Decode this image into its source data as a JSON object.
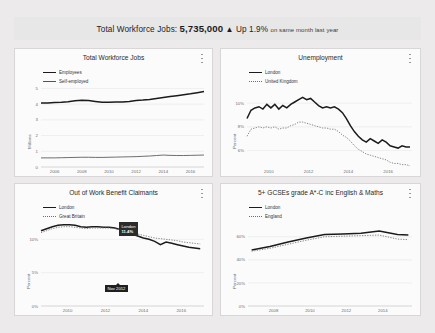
{
  "banner": {
    "label": "Total Workforce Jobs:",
    "value": "5,735,000",
    "arrow": "▲",
    "change": "Up 1.9%",
    "suffix": "on same month last year"
  },
  "icons": {
    "info": "info-icon"
  },
  "chart_data": [
    {
      "type": "line",
      "title": "Total Workforce Jobs",
      "xlabel": "",
      "ylabel": "Millions",
      "ylim": [
        0,
        5.6
      ],
      "yticks": [
        "0",
        "1",
        "2",
        "3",
        "4",
        "5"
      ],
      "ytickvals": [
        0,
        1,
        2,
        3,
        4,
        5
      ],
      "xlim": [
        2005.0,
        2017.0
      ],
      "xticks": [
        "2006",
        "2008",
        "2010",
        "2012",
        "2014",
        "2016"
      ],
      "xtickvals": [
        2006,
        2008,
        2010,
        2012,
        2014,
        2016
      ],
      "grid": true,
      "legend_position": "top-left",
      "x": [
        2005.0,
        2005.5,
        2006.0,
        2006.5,
        2007.0,
        2007.5,
        2008.0,
        2008.5,
        2009.0,
        2009.5,
        2010.0,
        2010.5,
        2011.0,
        2011.5,
        2012.0,
        2012.5,
        2013.0,
        2013.5,
        2014.0,
        2014.5,
        2015.0,
        2015.5,
        2016.0,
        2016.5,
        2017.0
      ],
      "series": [
        {
          "name": "Employees",
          "style": "solid",
          "values": [
            4.08,
            4.08,
            4.1,
            4.12,
            4.16,
            4.21,
            4.25,
            4.23,
            4.17,
            4.12,
            4.12,
            4.14,
            4.13,
            4.17,
            4.23,
            4.26,
            4.3,
            4.36,
            4.42,
            4.48,
            4.54,
            4.6,
            4.66,
            4.73,
            4.8
          ]
        },
        {
          "name": "Self-employed",
          "style": "thin",
          "values": [
            0.58,
            0.58,
            0.58,
            0.59,
            0.6,
            0.61,
            0.62,
            0.62,
            0.61,
            0.61,
            0.62,
            0.63,
            0.64,
            0.65,
            0.66,
            0.68,
            0.7,
            0.73,
            0.76,
            0.74,
            0.73,
            0.73,
            0.74,
            0.75,
            0.76
          ]
        }
      ]
    },
    {
      "type": "line",
      "title": "Unemployment",
      "xlabel": "",
      "ylabel": "Percent",
      "ylim": [
        4.6,
        11.2
      ],
      "yticks": [
        "6%",
        "8%",
        "10%"
      ],
      "ytickvals": [
        6,
        8,
        10
      ],
      "xlim": [
        2008.9,
        2017.2
      ],
      "xticks": [
        "2010",
        "2012",
        "2014",
        "2016"
      ],
      "xtickvals": [
        2010,
        2012,
        2014,
        2016
      ],
      "grid": true,
      "legend_position": "top-left",
      "x": [
        2008.9,
        2009.1,
        2009.3,
        2009.5,
        2009.7,
        2009.9,
        2010.1,
        2010.3,
        2010.5,
        2010.7,
        2010.9,
        2011.1,
        2011.3,
        2011.5,
        2011.7,
        2011.9,
        2012.1,
        2012.3,
        2012.5,
        2012.7,
        2012.9,
        2013.1,
        2013.3,
        2013.5,
        2013.7,
        2013.9,
        2014.1,
        2014.3,
        2014.5,
        2014.7,
        2014.9,
        2015.1,
        2015.3,
        2015.5,
        2015.7,
        2015.9,
        2016.1,
        2016.3,
        2016.5,
        2016.7,
        2016.9,
        2017.1
      ],
      "series": [
        {
          "name": "London",
          "style": "solid",
          "values": [
            8.7,
            9.4,
            9.6,
            9.7,
            9.5,
            9.9,
            9.6,
            9.9,
            9.5,
            9.8,
            9.6,
            9.9,
            10.1,
            10.3,
            10.5,
            10.3,
            10.4,
            10.1,
            9.8,
            9.6,
            9.7,
            9.6,
            9.7,
            9.5,
            9.2,
            8.7,
            8.1,
            7.6,
            7.2,
            6.9,
            6.7,
            7.0,
            6.8,
            6.6,
            6.9,
            6.7,
            6.4,
            6.3,
            6.2,
            6.4,
            6.3,
            6.3
          ]
        },
        {
          "name": "United Kingdom",
          "style": "dotted",
          "values": [
            7.2,
            7.8,
            7.9,
            8.0,
            7.9,
            8.0,
            7.9,
            8.0,
            7.8,
            7.9,
            7.9,
            8.1,
            8.2,
            8.4,
            8.4,
            8.3,
            8.2,
            8.1,
            8.0,
            7.9,
            7.9,
            7.8,
            7.8,
            7.6,
            7.3,
            7.1,
            6.8,
            6.4,
            6.1,
            5.9,
            5.7,
            5.6,
            5.5,
            5.4,
            5.3,
            5.2,
            5.0,
            4.9,
            4.9,
            4.8,
            4.8,
            4.7
          ]
        }
      ]
    },
    {
      "type": "line",
      "title": "Out of Work Benefit Claimants",
      "xlabel": "",
      "ylabel": "Percent",
      "ylim": [
        0,
        13.5
      ],
      "yticks": [
        "0%",
        "5%",
        "10%"
      ],
      "ytickvals": [
        0,
        5,
        10
      ],
      "xlim": [
        2008.6,
        2017.2
      ],
      "xticks": [
        "2010",
        "2012",
        "2014",
        "2016"
      ],
      "xtickvals": [
        2010,
        2012,
        2014,
        2016
      ],
      "grid": true,
      "legend_position": "top-left",
      "x": [
        2008.6,
        2008.9,
        2009.2,
        2009.5,
        2009.8,
        2010.1,
        2010.4,
        2010.7,
        2011.0,
        2011.3,
        2011.6,
        2011.9,
        2012.2,
        2012.5,
        2012.85,
        2013.1,
        2013.4,
        2013.7,
        2014.0,
        2014.3,
        2014.6,
        2014.9,
        2015.2,
        2015.5,
        2015.8,
        2016.1,
        2016.4,
        2016.7,
        2017.0
      ],
      "series": [
        {
          "name": "London",
          "style": "solid",
          "values": [
            11.3,
            11.6,
            11.9,
            12.1,
            12.2,
            12.2,
            12.1,
            11.9,
            11.8,
            11.9,
            11.9,
            11.8,
            11.8,
            11.7,
            11.4,
            11.1,
            10.8,
            10.5,
            10.2,
            10.0,
            9.7,
            9.2,
            9.6,
            9.4,
            9.2,
            9.0,
            8.8,
            8.7,
            8.6
          ]
        },
        {
          "name": "Great Britain",
          "style": "dotted",
          "values": [
            11.0,
            11.3,
            11.6,
            11.8,
            11.9,
            11.9,
            11.8,
            11.7,
            11.6,
            11.7,
            11.7,
            11.7,
            11.7,
            11.6,
            11.4,
            11.2,
            11.0,
            10.8,
            10.6,
            10.4,
            10.2,
            10.1,
            10.0,
            9.9,
            9.8,
            9.6,
            9.5,
            9.4,
            9.3
          ]
        }
      ],
      "annotation": {
        "series_label": "London",
        "value": "11.4%",
        "x_label": "Nov 2012",
        "point_x": 2012.85,
        "point_y": 11.4
      }
    },
    {
      "type": "line",
      "title": "5+ GCSEs grade A*-C inc English & Maths",
      "xlabel": "",
      "ylabel": "Percent",
      "ylim": [
        0,
        78
      ],
      "yticks": [
        "0%",
        "20%",
        "40%",
        "60%"
      ],
      "ytickvals": [
        0,
        20,
        40,
        60
      ],
      "xlim": [
        2006.6,
        2015.6
      ],
      "xticks": [
        "2008",
        "2010",
        "2012",
        "2014"
      ],
      "xtickvals": [
        2008,
        2010,
        2012,
        2014
      ],
      "grid": true,
      "legend_position": "top-left",
      "x": [
        2006.8,
        2007.8,
        2008.8,
        2009.8,
        2010.8,
        2011.8,
        2012.8,
        2013.8,
        2014.8,
        2015.4
      ],
      "series": [
        {
          "name": "London",
          "style": "solid",
          "values": [
            48.5,
            51.5,
            55.5,
            59.0,
            62.0,
            62.5,
            63.0,
            65.0,
            62.0,
            61.5
          ]
        },
        {
          "name": "England",
          "style": "dotted",
          "values": [
            47.5,
            50.0,
            53.5,
            57.0,
            60.0,
            60.5,
            61.0,
            61.5,
            58.0,
            57.5
          ]
        }
      ]
    }
  ]
}
